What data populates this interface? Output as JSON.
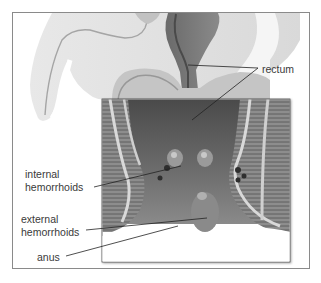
{
  "diagram": {
    "labels": {
      "rectum": "rectum",
      "internal_line1": "internal",
      "internal_line2": "hemorrhoids",
      "external_line1": "external",
      "external_line2": "hemorrhoids",
      "anus": "anus"
    },
    "colors": {
      "frame_border": "#8a8a8a",
      "body_silhouette": "#e4e4e4",
      "tissue_dark": "#5a5a5a",
      "tissue_mid": "#8c8c8c",
      "label_text": "#3a3a3a",
      "leader_line": "#222222"
    }
  }
}
